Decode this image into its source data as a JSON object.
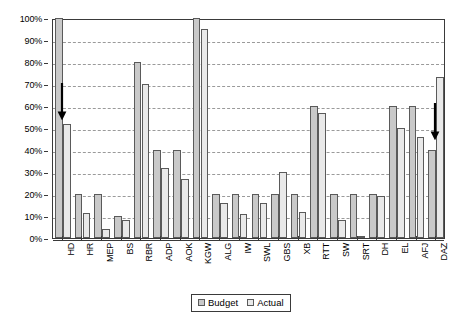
{
  "chart_data": {
    "type": "bar",
    "title": "",
    "subtitle": "",
    "xlabel": "",
    "ylabel": "",
    "ylim": [
      0,
      100
    ],
    "y_unit": "%",
    "grid": true,
    "legend_position": "bottom-center",
    "categories": [
      "HD",
      "HR",
      "MEP",
      "BS",
      "RBR",
      "ADP",
      "AOK",
      "KGW",
      "ALG",
      "IW",
      "SWL",
      "GBS",
      "XB",
      "RTT",
      "SW",
      "SRT",
      "DH",
      "EL",
      "AFJ",
      "DAZ"
    ],
    "series": [
      {
        "name": "Budget",
        "color": "#c9c9c9",
        "values": [
          100,
          20,
          20,
          10,
          80,
          40,
          40,
          100,
          20,
          20,
          20,
          20,
          20,
          60,
          20,
          20,
          20,
          60,
          60,
          40
        ]
      },
      {
        "name": "Actual",
        "color": "#e9e9e9",
        "values": [
          52,
          11.5,
          4,
          8,
          70,
          32,
          27,
          95,
          16,
          11,
          16,
          30,
          12,
          57,
          8,
          1,
          19,
          50,
          46,
          73
        ]
      }
    ],
    "y_ticks": [
      {
        "value": 0,
        "label": "0%"
      },
      {
        "value": 10,
        "label": "10%"
      },
      {
        "value": 20,
        "label": "20%"
      },
      {
        "value": 30,
        "label": "30%"
      },
      {
        "value": 40,
        "label": "40%"
      },
      {
        "value": 50,
        "label": "50%"
      },
      {
        "value": 60,
        "label": "60%"
      },
      {
        "value": 70,
        "label": "70%"
      },
      {
        "value": 80,
        "label": "80%"
      },
      {
        "value": 90,
        "label": "90%"
      },
      {
        "value": 100,
        "label": "100%"
      }
    ],
    "annotations": [
      {
        "name": "arrow-hd",
        "category": "HD",
        "from_value": 71,
        "to_value": 54,
        "direction": "down"
      },
      {
        "name": "arrow-daz",
        "category": "DAZ",
        "from_value": 62,
        "to_value": 45,
        "direction": "down"
      }
    ]
  },
  "legend": {
    "budget_label": "Budget",
    "actual_label": "Actual"
  },
  "colors": {
    "budget": "#c9c9c9",
    "actual": "#e9e9e9",
    "bar_border": "#5a5a5a",
    "axis": "#3a3a3a",
    "grid": "#9a9a9a",
    "background": "#ffffff"
  }
}
